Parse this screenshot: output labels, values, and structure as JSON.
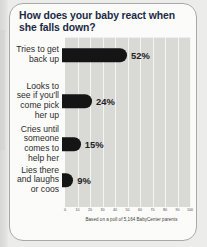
{
  "card": {
    "title": "How does your baby react when she falls down?",
    "footnote": "Based on a poll of 5,164 BabyCenter parents"
  },
  "colors": {
    "title_text": "#1b2a44",
    "bar_fill": "#151515",
    "plot_background": "#d9d9d6",
    "gridline": "#f4f4f2",
    "card_border": "#a9a9a6",
    "page_background": "#ececeb"
  },
  "chart_data": {
    "type": "bar",
    "orientation": "horizontal",
    "title": "How does your baby react when she falls down?",
    "xlabel": "",
    "ylabel": "",
    "xlim": [
      0,
      100
    ],
    "grid": true,
    "legend": false,
    "unit": "%",
    "source_note": "Based on a poll of 5,164 BabyCenter parents",
    "sample_size": 5164,
    "categories": [
      "Tries to get back up",
      "Looks to see if you'll come pick her up",
      "Cries until someone comes to help her",
      "Lies there and laughs or coos"
    ],
    "values": [
      52,
      24,
      15,
      9
    ],
    "value_labels": [
      "52%",
      "24%",
      "15%",
      "9%"
    ],
    "xticks": [
      0,
      10,
      20,
      30,
      40,
      50,
      60,
      70,
      80,
      90,
      100
    ],
    "xtick_labels": [
      "0",
      "10",
      "20",
      "30",
      "40",
      "50",
      "60",
      "70",
      "80",
      "90",
      "100"
    ]
  },
  "rows": [
    {
      "label": "Tries to get\nback up",
      "value": 52,
      "value_label": "52%"
    },
    {
      "label": "Looks to\nsee if you'll\ncome pick\nher up",
      "value": 24,
      "value_label": "24%"
    },
    {
      "label": "Cries until\nsomeone\ncomes to\nhelp her",
      "value": 15,
      "value_label": "15%"
    },
    {
      "label": "Lies there\nand laughs\nor coos",
      "value": 9,
      "value_label": "9%"
    }
  ]
}
